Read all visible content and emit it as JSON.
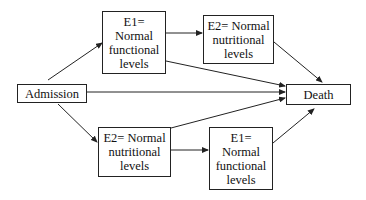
{
  "diagram": {
    "nodes": {
      "admission": {
        "label": "Admission"
      },
      "e1_top": {
        "label": "E1=\nNormal\nfunctional\nlevels"
      },
      "e2_top": {
        "label": "E2= Normal\nnutritional\nlevels"
      },
      "death": {
        "label": "Death"
      },
      "e2_bottom": {
        "label": "E2= Normal\nnutritional\nlevels"
      },
      "e1_bottom": {
        "label": "E1=\nNormal\nfunctional\nlevels"
      }
    },
    "edges": [
      {
        "from": "Admission",
        "to": "E1= Normal functional levels (top)"
      },
      {
        "from": "E1= Normal functional levels (top)",
        "to": "E2= Normal nutritional levels (top)"
      },
      {
        "from": "E2= Normal nutritional levels (top)",
        "to": "Death"
      },
      {
        "from": "E1= Normal functional levels (top)",
        "to": "Death"
      },
      {
        "from": "Admission",
        "to": "Death"
      },
      {
        "from": "Admission",
        "to": "E2= Normal nutritional levels (bottom)"
      },
      {
        "from": "E2= Normal nutritional levels (bottom)",
        "to": "E1= Normal functional levels (bottom)"
      },
      {
        "from": "E2= Normal nutritional levels (bottom)",
        "to": "Death"
      },
      {
        "from": "E1= Normal functional levels (bottom)",
        "to": "Death"
      }
    ]
  }
}
